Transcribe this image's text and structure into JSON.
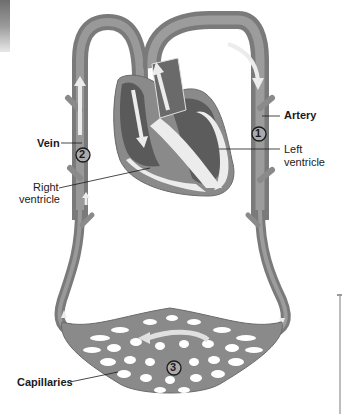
{
  "diagram": {
    "labels": {
      "artery": "Artery",
      "left_ventricle_line1": "Left",
      "left_ventricle_line2": "ventricle",
      "vein": "Vein",
      "right_ventricle_line1": "Right",
      "right_ventricle_line2": "ventricle",
      "capillaries": "Capillaries"
    },
    "markers": {
      "artery_marker": "1",
      "vein_marker": "2",
      "capillary_marker": "3"
    },
    "colors": {
      "vessel": "#8a8a8a",
      "vessel_dark": "#6f6f6f",
      "heart_chamber": "#5c5c5c",
      "heart_wall": "#e9e9e9",
      "arrow": "#e6e6e6",
      "background": "#ffffff"
    }
  }
}
